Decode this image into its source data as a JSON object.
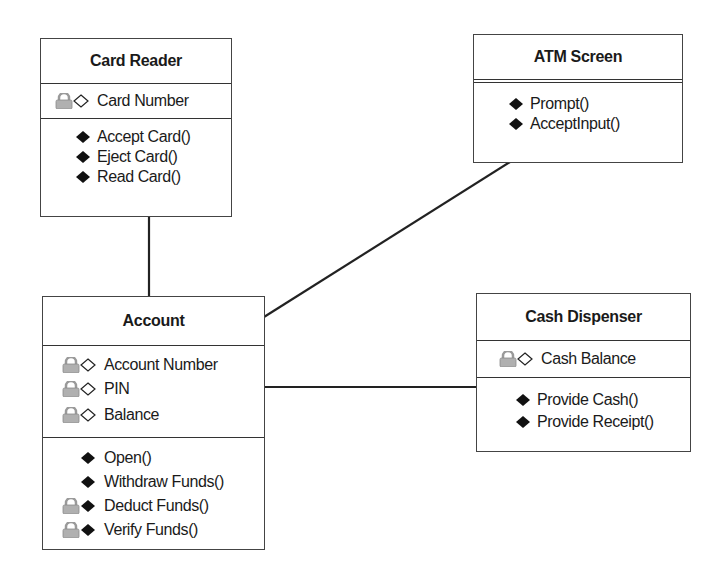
{
  "diagram": {
    "type": "UML class diagram",
    "classes": [
      {
        "id": "card-reader",
        "name": "Card Reader",
        "attributes": [
          {
            "label": "Card Number",
            "visibility": "private"
          }
        ],
        "operations": [
          {
            "label": "Accept Card()",
            "visibility": "public"
          },
          {
            "label": "Eject Card()",
            "visibility": "public"
          },
          {
            "label": "Read Card()",
            "visibility": "public"
          }
        ]
      },
      {
        "id": "atm-screen",
        "name": "ATM Screen",
        "attributes": [],
        "operations": [
          {
            "label": "Prompt()",
            "visibility": "public"
          },
          {
            "label": "AcceptInput()",
            "visibility": "public"
          }
        ]
      },
      {
        "id": "account",
        "name": "Account",
        "attributes": [
          {
            "label": "Account Number",
            "visibility": "private"
          },
          {
            "label": "PIN",
            "visibility": "private"
          },
          {
            "label": "Balance",
            "visibility": "private"
          }
        ],
        "operations": [
          {
            "label": "Open()",
            "visibility": "public"
          },
          {
            "label": "Withdraw Funds()",
            "visibility": "public"
          },
          {
            "label": "Deduct Funds()",
            "visibility": "private"
          },
          {
            "label": "Verify Funds()",
            "visibility": "private"
          }
        ]
      },
      {
        "id": "cash-dispenser",
        "name": "Cash Dispenser",
        "attributes": [
          {
            "label": "Cash Balance",
            "visibility": "private"
          }
        ],
        "operations": [
          {
            "label": "Provide Cash()",
            "visibility": "public"
          },
          {
            "label": "Provide Receipt()",
            "visibility": "public"
          }
        ]
      }
    ],
    "associations": [
      {
        "from": "Card Reader",
        "to": "Account"
      },
      {
        "from": "Account",
        "to": "ATM Screen"
      },
      {
        "from": "Account",
        "to": "Cash Dispenser"
      }
    ],
    "icons": {
      "attribute": "lock-icon + hollow-diamond-icon",
      "public_operation": "filled-diamond-icon",
      "private_operation": "lock-icon + filled-diamond-icon"
    },
    "colors": {
      "border": "#444444",
      "text": "#1a1a1a",
      "lock": "#a8a8a8",
      "diamond_fill": "#111111"
    }
  }
}
